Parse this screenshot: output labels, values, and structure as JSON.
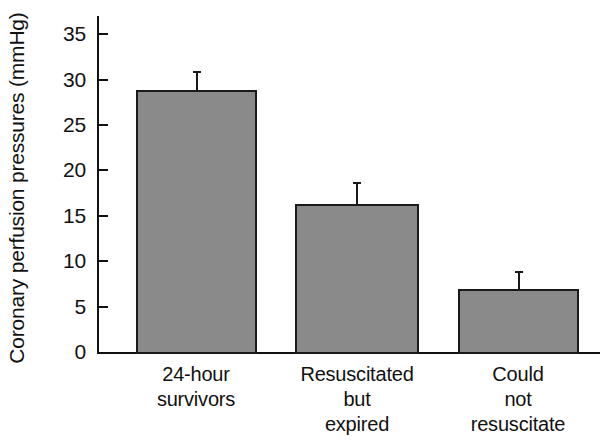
{
  "chart_data": {
    "type": "bar",
    "title": "",
    "subtitle": "",
    "xlabel": "",
    "ylabel": "Coronary perfusion pressures (mmHg)",
    "categories": [
      "24-hour survivors",
      "Resuscitated but expired",
      "Could not resuscitate"
    ],
    "category_lines": [
      [
        "24-hour",
        "survivors"
      ],
      [
        "Resuscitated",
        "but",
        "expired"
      ],
      [
        "Could",
        "not",
        "resuscitate"
      ]
    ],
    "values": [
      28.9,
      16.3,
      6.9
    ],
    "errors": [
      2.0,
      2.4,
      2.0
    ],
    "error_type": "upper-only",
    "ylim": [
      0,
      37
    ],
    "yticks": [
      0,
      5,
      10,
      15,
      20,
      25,
      30,
      35
    ],
    "ytick_labels": [
      "0",
      "5",
      "10",
      "15",
      "20",
      "25",
      "30",
      "35"
    ],
    "grid": false,
    "legend": false,
    "legend_position": "none",
    "bar_color": "#8a8a8a",
    "bar_edge_color": "#1a1a1a",
    "axis_color": "#111111"
  }
}
